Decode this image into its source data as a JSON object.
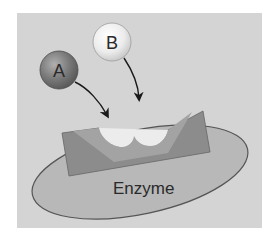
{
  "diagram": {
    "panel": {
      "background": "#d4d4d4"
    },
    "substrates": [
      {
        "id": "A",
        "label": "A",
        "shade": "dark",
        "fill": "#7a7a7a",
        "highlight": "#b0b0b0"
      },
      {
        "id": "B",
        "label": "B",
        "shade": "light",
        "fill": "#e6e6e6",
        "highlight": "#ffffff"
      }
    ],
    "arrows": [
      {
        "from": "A",
        "to": "active-site"
      },
      {
        "from": "B",
        "to": "active-site"
      }
    ],
    "enzyme": {
      "label": "Enzyme",
      "body_fill": "#b8b8b8",
      "block_fill": "#8c8c8c",
      "block_inner_fill": "#a3a3a3",
      "active_site_notches": 2
    }
  }
}
